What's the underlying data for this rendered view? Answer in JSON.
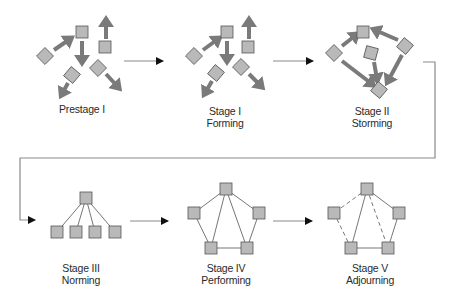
{
  "colors": {
    "node_fill": "#b9b9b9",
    "node_stroke": "#555555",
    "arrow": "#7a7a7a",
    "line": "#666666",
    "connector": "#8a8a8a",
    "arrowhead": "#111111"
  },
  "stages": [
    {
      "id": "prestage-1",
      "title": "Prestage I",
      "subtitle": "",
      "label_pos": [
        82,
        104
      ],
      "nodes": [
        {
          "x": 45,
          "y": 56,
          "rot": 45
        },
        {
          "x": 82,
          "y": 32,
          "rot": 0
        },
        {
          "x": 105,
          "y": 47,
          "rot": 0
        },
        {
          "x": 72,
          "y": 75,
          "rot": 40
        },
        {
          "x": 98,
          "y": 68,
          "rot": 45
        }
      ],
      "thick_arrows": [
        {
          "x1": 54,
          "y1": 50,
          "x2": 70,
          "y2": 39
        },
        {
          "x1": 82,
          "y1": 41,
          "x2": 82,
          "y2": 61
        },
        {
          "x1": 106,
          "y1": 39,
          "x2": 106,
          "y2": 21
        },
        {
          "x1": 68,
          "y1": 83,
          "x2": 62,
          "y2": 94
        },
        {
          "x1": 106,
          "y1": 74,
          "x2": 118,
          "y2": 87
        }
      ],
      "edges": []
    },
    {
      "id": "stage-1",
      "title": "Stage I",
      "subtitle": "Forming",
      "label_pos": [
        225,
        106
      ],
      "nodes": [
        {
          "x": 194,
          "y": 56,
          "rot": 45
        },
        {
          "x": 227,
          "y": 32,
          "rot": 0
        },
        {
          "x": 248,
          "y": 47,
          "rot": 0
        },
        {
          "x": 216,
          "y": 73,
          "rot": 40
        },
        {
          "x": 241,
          "y": 67,
          "rot": 45
        }
      ],
      "thick_arrows": [
        {
          "x1": 203,
          "y1": 50,
          "x2": 218,
          "y2": 39
        },
        {
          "x1": 227,
          "y1": 41,
          "x2": 227,
          "y2": 60
        },
        {
          "x1": 249,
          "y1": 39,
          "x2": 249,
          "y2": 21
        },
        {
          "x1": 212,
          "y1": 81,
          "x2": 205,
          "y2": 93
        },
        {
          "x1": 249,
          "y1": 74,
          "x2": 261,
          "y2": 86
        }
      ],
      "edges": []
    },
    {
      "id": "stage-2",
      "title": "Stage II",
      "subtitle": "Storming",
      "label_pos": [
        372,
        106
      ],
      "nodes": [
        {
          "x": 363,
          "y": 32,
          "rot": 0
        },
        {
          "x": 334,
          "y": 53,
          "rot": 45
        },
        {
          "x": 405,
          "y": 46,
          "rot": 40
        },
        {
          "x": 371,
          "y": 53,
          "rot": 15
        },
        {
          "x": 379,
          "y": 90,
          "rot": 40
        }
      ],
      "thick_arrows": [
        {
          "x1": 342,
          "y1": 46,
          "x2": 356,
          "y2": 35
        },
        {
          "x1": 398,
          "y1": 40,
          "x2": 375,
          "y2": 30
        },
        {
          "x1": 342,
          "y1": 61,
          "x2": 372,
          "y2": 84
        },
        {
          "x1": 374,
          "y1": 62,
          "x2": 377,
          "y2": 79
        },
        {
          "x1": 402,
          "y1": 55,
          "x2": 388,
          "y2": 81
        }
      ],
      "edges": []
    },
    {
      "id": "stage-3",
      "title": "Stage III",
      "subtitle": "Norming",
      "label_pos": [
        81,
        263
      ],
      "nodes": [
        {
          "x": 86,
          "y": 198,
          "rot": 0
        },
        {
          "x": 57,
          "y": 232,
          "rot": 0
        },
        {
          "x": 76,
          "y": 232,
          "rot": 0
        },
        {
          "x": 95,
          "y": 232,
          "rot": 0
        },
        {
          "x": 115,
          "y": 232,
          "rot": 0
        }
      ],
      "thick_arrows": [],
      "edges": [
        {
          "a": 0,
          "b": 1,
          "dashed": false
        },
        {
          "a": 0,
          "b": 2,
          "dashed": false
        },
        {
          "a": 0,
          "b": 3,
          "dashed": false
        },
        {
          "a": 0,
          "b": 4,
          "dashed": false
        }
      ]
    },
    {
      "id": "stage-4",
      "title": "Stage IV",
      "subtitle": "Performing",
      "label_pos": [
        226,
        263
      ],
      "nodes": [
        {
          "x": 226,
          "y": 189,
          "rot": 0
        },
        {
          "x": 194,
          "y": 213,
          "rot": 0
        },
        {
          "x": 259,
          "y": 213,
          "rot": 0
        },
        {
          "x": 211,
          "y": 248,
          "rot": 0
        },
        {
          "x": 247,
          "y": 248,
          "rot": 0
        }
      ],
      "thick_arrows": [],
      "edges": [
        {
          "a": 0,
          "b": 1,
          "dashed": false
        },
        {
          "a": 0,
          "b": 2,
          "dashed": false
        },
        {
          "a": 0,
          "b": 3,
          "dashed": false
        },
        {
          "a": 0,
          "b": 4,
          "dashed": false
        },
        {
          "a": 1,
          "b": 3,
          "dashed": false
        },
        {
          "a": 2,
          "b": 4,
          "dashed": false
        },
        {
          "a": 3,
          "b": 4,
          "dashed": false
        }
      ]
    },
    {
      "id": "stage-5",
      "title": "Stage V",
      "subtitle": "Adjourning",
      "label_pos": [
        370,
        263
      ],
      "nodes": [
        {
          "x": 367,
          "y": 189,
          "rot": 0
        },
        {
          "x": 334,
          "y": 213,
          "rot": 0
        },
        {
          "x": 399,
          "y": 213,
          "rot": 0
        },
        {
          "x": 351,
          "y": 248,
          "rot": 0
        },
        {
          "x": 388,
          "y": 248,
          "rot": 0
        }
      ],
      "thick_arrows": [],
      "edges": [
        {
          "a": 0,
          "b": 1,
          "dashed": true
        },
        {
          "a": 0,
          "b": 2,
          "dashed": false
        },
        {
          "a": 0,
          "b": 3,
          "dashed": false
        },
        {
          "a": 0,
          "b": 4,
          "dashed": true
        },
        {
          "a": 1,
          "b": 3,
          "dashed": true
        },
        {
          "a": 2,
          "b": 4,
          "dashed": false
        },
        {
          "a": 3,
          "b": 4,
          "dashed": false
        }
      ]
    }
  ],
  "flow_arrows": [
    {
      "from": "prestage-1",
      "to": "stage-1",
      "points": [
        [
          124,
          61
        ],
        [
          163,
          61
        ]
      ]
    },
    {
      "from": "stage-1",
      "to": "stage-2",
      "points": [
        [
          273,
          61
        ],
        [
          313,
          61
        ]
      ]
    },
    {
      "from": "stage-2",
      "to": "stage-3",
      "points": [
        [
          423,
          62
        ],
        [
          435,
          62
        ],
        [
          435,
          158
        ],
        [
          20,
          158
        ],
        [
          20,
          220
        ],
        [
          35,
          220
        ]
      ]
    },
    {
      "from": "stage-3",
      "to": "stage-4",
      "points": [
        [
          130,
          221
        ],
        [
          168,
          221
        ]
      ]
    },
    {
      "from": "stage-4",
      "to": "stage-5",
      "points": [
        [
          273,
          221
        ],
        [
          312,
          221
        ]
      ]
    }
  ],
  "node_size": 12
}
